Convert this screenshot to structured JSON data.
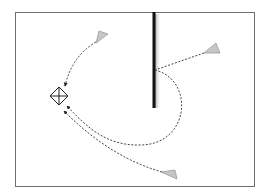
{
  "diagram": {
    "type": "signal-reflection-diagram",
    "frame": {
      "x": 15,
      "y": 12,
      "width": 240,
      "height": 175,
      "stroke": "#6e6e6e"
    },
    "target": {
      "name": "receiver",
      "shape": "diamond-with-cross",
      "cx": 59,
      "cy": 96,
      "size": 9,
      "stroke": "#222222"
    },
    "wall": {
      "name": "obstacle-wall",
      "x": 154,
      "y1": 12,
      "y2": 108,
      "width": 3,
      "color": "#111111",
      "shadow": "#bdbdbd"
    },
    "sources": [
      {
        "name": "source-top-left",
        "points": "96,42 108,34 100,32"
      },
      {
        "name": "source-top-right",
        "points": "204,53 220,51 218,42"
      },
      {
        "name": "source-bottom-right",
        "points": "162,172 178,178 176,170"
      }
    ],
    "paths": [
      {
        "name": "path-top-left-to-target",
        "d": "M 96,42 Q 72,56 65,86"
      },
      {
        "name": "path-top-right-reflect-wall",
        "d": "M 204,53 L 155,70"
      },
      {
        "name": "path-wall-loop-to-target",
        "d": "M 155,70 C 195,80 190,145 140,145 C 105,146 85,125 67,106"
      },
      {
        "name": "path-bottom-right-to-target",
        "d": "M 162,172 C 120,160 88,135 64,111"
      }
    ],
    "colors": {
      "source_fill": "#c6c6c6",
      "source_stroke": "#9a9a9a",
      "path": "#444444"
    }
  }
}
